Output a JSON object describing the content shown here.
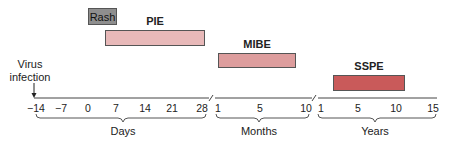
{
  "diagram": {
    "event_label": "Virus infection",
    "rash_label": "Rash",
    "bars": [
      {
        "label": "PIE",
        "color": "#e8b9b9",
        "start": "7 days",
        "end": "28 days"
      },
      {
        "label": "MIBE",
        "color": "#dd9d9d",
        "start": "1 month",
        "end": "~9 months"
      },
      {
        "label": "SSPE",
        "color": "#c95a5a",
        "start": "~3 years",
        "end": "~11 years"
      }
    ],
    "axis": {
      "days": {
        "label": "Days",
        "ticks": [
          "−14",
          "−7",
          "0",
          "7",
          "14",
          "21",
          "28"
        ]
      },
      "months": {
        "label": "Months",
        "ticks": [
          "1",
          "5",
          "10"
        ]
      },
      "years": {
        "label": "Years",
        "ticks": [
          "1",
          "5",
          "10",
          "15"
        ]
      }
    }
  }
}
